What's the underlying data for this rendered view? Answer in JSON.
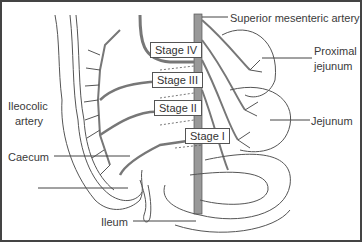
{
  "diagram": {
    "labels": {
      "sma": "Superior mesenteric artery",
      "proximal_jejunum_1": "Proximal",
      "proximal_jejunum_2": "jejunum",
      "jejunum": "Jejunum",
      "ileocolic_1": "Ileocolic",
      "ileocolic_2": "artery",
      "caecum": "Caecum",
      "ileum": "Ileum"
    },
    "stages": [
      "Stage IV",
      "Stage III",
      "Stage II",
      "Stage I"
    ],
    "colors": {
      "line": "#555555",
      "vessel": "#777777",
      "border": "#444444"
    }
  }
}
